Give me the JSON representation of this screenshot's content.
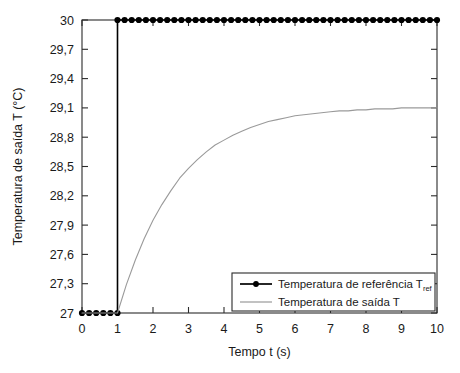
{
  "chart_data": {
    "type": "line",
    "title": "",
    "xlabel": "Tempo  t (s)",
    "ylabel": "Temperatura de saída T (°C)",
    "xlim": [
      0,
      10
    ],
    "ylim": [
      27,
      30
    ],
    "grid": false,
    "legend_position": "lower right",
    "x_ticks": [
      0,
      1,
      2,
      3,
      4,
      5,
      6,
      7,
      8,
      9,
      10
    ],
    "x_tick_labels": [
      "0",
      "1",
      "2",
      "3",
      "4",
      "5",
      "6",
      "7",
      "8",
      "9",
      "10"
    ],
    "y_ticks": [
      27,
      27.3,
      27.6,
      27.9,
      28.2,
      28.5,
      28.8,
      29.1,
      29.4,
      29.7,
      30
    ],
    "y_tick_labels": [
      "27",
      "27,3",
      "27,6",
      "27,9",
      "28,2",
      "28,5",
      "28,8",
      "29,1",
      "29,4",
      "29,7",
      "30"
    ],
    "series": [
      {
        "name": "Temperatura de referência T",
        "name_subscript": "ref",
        "color": "#000000",
        "marker": "circle",
        "marker_size": 3.1,
        "line_width": 1.6,
        "description": "step reference from 27 at t=0 to 30 at t=1",
        "x": [
          0,
          0.2,
          0.4,
          0.6,
          0.8,
          1,
          1,
          1.2,
          1.4,
          1.6,
          1.8,
          2,
          2.2,
          2.4,
          2.6,
          2.8,
          3,
          3.2,
          3.4,
          3.6,
          3.8,
          4,
          4.2,
          4.4,
          4.6,
          4.8,
          5,
          5.2,
          5.4,
          5.6,
          5.8,
          6,
          6.2,
          6.4,
          6.6,
          6.8,
          7,
          7.2,
          7.4,
          7.6,
          7.8,
          8,
          8.2,
          8.4,
          8.6,
          8.8,
          9,
          9.2,
          9.4,
          9.6,
          9.8,
          10
        ],
        "y": [
          27,
          27,
          27,
          27,
          27,
          27,
          30,
          30,
          30,
          30,
          30,
          30,
          30,
          30,
          30,
          30,
          30,
          30,
          30,
          30,
          30,
          30,
          30,
          30,
          30,
          30,
          30,
          30,
          30,
          30,
          30,
          30,
          30,
          30,
          30,
          30,
          30,
          30,
          30,
          30,
          30,
          30,
          30,
          30,
          30,
          30,
          30,
          30,
          30,
          30,
          30,
          30
        ]
      },
      {
        "name": "Temperatura de saída T",
        "name_subscript": "",
        "color": "#9a9a9a",
        "marker": "none",
        "marker_size": 0,
        "line_width": 1.1,
        "description": "first-order step response, flat at 27 until t=1 then exponential rise to steady state 28,93 with time constant about 1.55 s",
        "steady_state": 28.93,
        "time_constant": 1.55,
        "step_time": 1,
        "x": [
          0,
          0.25,
          0.5,
          0.75,
          1,
          1.25,
          1.5,
          1.75,
          2,
          2.25,
          2.5,
          2.75,
          3,
          3.25,
          3.5,
          3.75,
          4,
          4.25,
          4.5,
          4.75,
          5,
          5.25,
          5.5,
          5.75,
          6,
          6.25,
          6.5,
          6.75,
          7,
          7.25,
          7.5,
          7.75,
          8,
          8.25,
          8.5,
          8.75,
          9,
          9.25,
          9.5,
          9.75,
          10
        ],
        "y": [
          27,
          27,
          27,
          27,
          27,
          27.29,
          27.54,
          27.76,
          27.95,
          28.11,
          28.25,
          28.38,
          28.48,
          28.57,
          28.65,
          28.72,
          28.77,
          28.82,
          28.86,
          28.9,
          28.93,
          28.96,
          28.98,
          29,
          29.02,
          29.03,
          29.04,
          29.05,
          29.06,
          29.07,
          29.07,
          29.08,
          29.08,
          29.09,
          29.09,
          29.09,
          29.1,
          29.1,
          29.1,
          29.1,
          29.1
        ]
      }
    ],
    "legend_entries": [
      {
        "label": "Temperatura de referência T",
        "subscript": "ref",
        "color": "#000000",
        "marker": "circle"
      },
      {
        "label": "Temperatura de saída T",
        "subscript": "",
        "color": "#9a9a9a",
        "marker": "none"
      }
    ]
  }
}
